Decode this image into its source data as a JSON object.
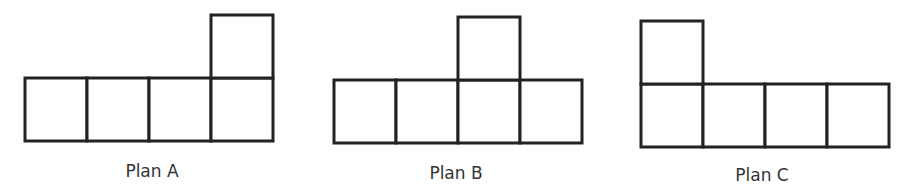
{
  "diagram": {
    "type": "net-plans",
    "cell_unit": "square",
    "colors": {
      "stroke": "#222222",
      "text": "#333333",
      "background": "#ffffff"
    },
    "plans": [
      {
        "label": "Plan A",
        "bottom_row_count": 4,
        "top_square_over_column": 4,
        "cells": [
          [
            0,
            1
          ],
          [
            1,
            1
          ],
          [
            2,
            1
          ],
          [
            3,
            1
          ],
          [
            3,
            0
          ]
        ]
      },
      {
        "label": "Plan B",
        "bottom_row_count": 4,
        "top_square_over_column": 3,
        "cells": [
          [
            0,
            1
          ],
          [
            1,
            1
          ],
          [
            2,
            1
          ],
          [
            3,
            1
          ],
          [
            2,
            0
          ]
        ]
      },
      {
        "label": "Plan C",
        "bottom_row_count": 4,
        "top_square_over_column": 1,
        "cells": [
          [
            0,
            1
          ],
          [
            1,
            1
          ],
          [
            2,
            1
          ],
          [
            3,
            1
          ],
          [
            0,
            0
          ]
        ]
      }
    ]
  }
}
